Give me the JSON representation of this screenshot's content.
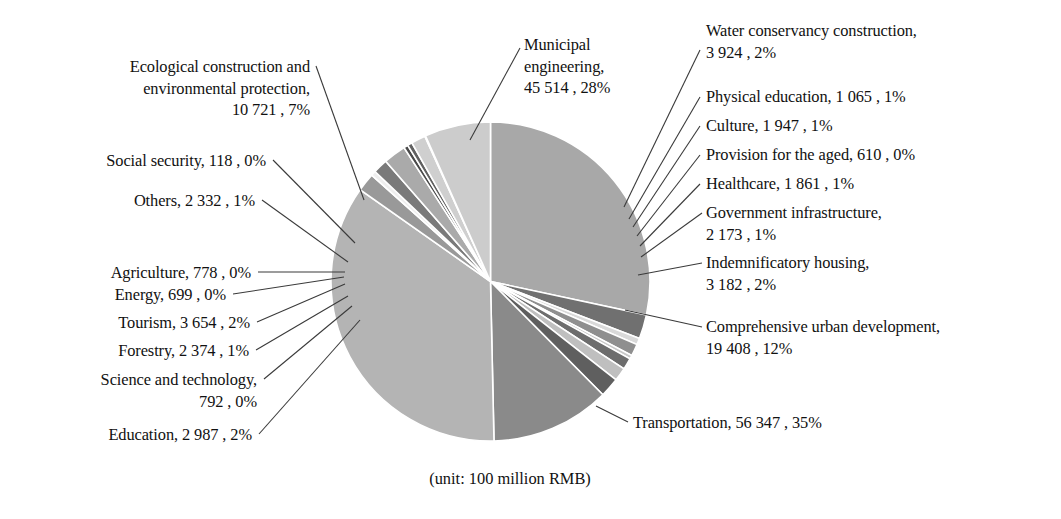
{
  "caption": "(unit: 100 million RMB)",
  "chart_data": {
    "type": "pie",
    "title": "",
    "subtitle": "",
    "unit_note": "(unit: 100 million RMB)",
    "value_unit": "100 million RMB",
    "total": 162486,
    "legend_position": "callout-labels",
    "start_angle_deg": 0,
    "direction": "clockwise",
    "categories": [
      "Municipal engineering",
      "Water conservancy construction",
      "Physical education",
      "Culture",
      "Provision for the aged",
      "Healthcare",
      "Government infrastructure",
      "Indemnificatory housing",
      "Comprehensive urban development",
      "Transportation",
      "Education",
      "Science and technology",
      "Forestry",
      "Tourism",
      "Energy",
      "Agriculture",
      "Others",
      "Social security",
      "Ecological construction and environmental protection"
    ],
    "values": [
      45514,
      3924,
      1065,
      1947,
      610,
      1861,
      2173,
      3182,
      19408,
      56347,
      2987,
      792,
      2374,
      3654,
      699,
      778,
      2332,
      118,
      10721
    ],
    "percent_labels": [
      "28%",
      "2%",
      "1%",
      "1%",
      "0%",
      "1%",
      "1%",
      "2%",
      "12%",
      "35%",
      "2%",
      "0%",
      "1%",
      "2%",
      "0%",
      "0%",
      "1%",
      "0%",
      "7%"
    ],
    "colors": [
      "#a8a8a8",
      "#707070",
      "#d9d9d9",
      "#8f8f8f",
      "#c8c8c8",
      "#6d6d6d",
      "#bfbfbf",
      "#5f5f5f",
      "#8a8a8a",
      "#b4b4b4",
      "#999999",
      "#efefef",
      "#7a7a7a",
      "#aaaaaa",
      "#4a4a4a",
      "#606060",
      "#cfcfcf",
      "#e6e6e6",
      "#cccccc"
    ],
    "slices": [
      {
        "label": "Municipal engineering",
        "value": "45 514",
        "percent": "28%",
        "text": "Municipal\nengineering,\n45 514 , 28%",
        "color": "#a8a8a8"
      },
      {
        "label": "Water conservancy construction",
        "value": "3 924",
        "percent": "2%",
        "text": "Water conservancy construction,\n3 924 , 2%",
        "color": "#707070"
      },
      {
        "label": "Physical education",
        "value": "1 065",
        "percent": "1%",
        "text": "Physical education, 1 065 , 1%",
        "color": "#d9d9d9"
      },
      {
        "label": "Culture",
        "value": "1 947",
        "percent": "1%",
        "text": "Culture, 1 947 , 1%",
        "color": "#8f8f8f"
      },
      {
        "label": "Provision for the aged",
        "value": "610",
        "percent": "0%",
        "text": "Provision for the aged, 610 , 0%",
        "color": "#c8c8c8"
      },
      {
        "label": "Healthcare",
        "value": "1 861",
        "percent": "1%",
        "text": "Healthcare, 1 861 , 1%",
        "color": "#6d6d6d"
      },
      {
        "label": "Government infrastructure",
        "value": "2 173",
        "percent": "1%",
        "text": "Government infrastructure,\n2 173 , 1%",
        "color": "#bfbfbf"
      },
      {
        "label": "Indemnificatory housing",
        "value": "3 182",
        "percent": "2%",
        "text": "Indemnificatory housing,\n3 182 , 2%",
        "color": "#5f5f5f"
      },
      {
        "label": "Comprehensive urban development",
        "value": "19 408",
        "percent": "12%",
        "text": "Comprehensive urban development,\n19 408 , 12%",
        "color": "#8a8a8a"
      },
      {
        "label": "Transportation",
        "value": "56 347",
        "percent": "35%",
        "text": "Transportation, 56 347 , 35%",
        "color": "#b4b4b4"
      },
      {
        "label": "Education",
        "value": "2 987",
        "percent": "2%",
        "text": "Education, 2 987 , 2%",
        "color": "#999999"
      },
      {
        "label": "Science and technology",
        "value": "792",
        "percent": "0%",
        "text": "Science and technology,\n792 , 0%",
        "color": "#efefef"
      },
      {
        "label": "Forestry",
        "value": "2 374",
        "percent": "1%",
        "text": "Forestry, 2 374 , 1%",
        "color": "#7a7a7a"
      },
      {
        "label": "Tourism",
        "value": "3 654",
        "percent": "2%",
        "text": "Tourism, 3 654 , 2%",
        "color": "#aaaaaa"
      },
      {
        "label": "Energy",
        "value": "699",
        "percent": "0%",
        "text": "Energy, 699 , 0%",
        "color": "#4a4a4a"
      },
      {
        "label": "Agriculture",
        "value": "778",
        "percent": "0%",
        "text": "Agriculture, 778 , 0%",
        "color": "#606060"
      },
      {
        "label": "Others",
        "value": "2 332",
        "percent": "1%",
        "text": "Others, 2 332 , 1%",
        "color": "#cfcfcf"
      },
      {
        "label": "Social security",
        "value": "118",
        "percent": "0%",
        "text": "Social security, 118 , 0%",
        "color": "#e6e6e6"
      },
      {
        "label": "Ecological construction and environmental protection",
        "value": "10 721",
        "percent": "7%",
        "text": "Ecological construction and\nenvironmental protection,\n10 721 , 7%",
        "color": "#cccccc"
      }
    ]
  },
  "labels": {
    "municipal_engineering": "Municipal\nengineering,\n45 514 , 28%",
    "water_conservancy": "Water conservancy construction,\n3 924 , 2%",
    "physical_education": "Physical education, 1 065 , 1%",
    "culture": "Culture, 1 947 , 1%",
    "provision_for_the_aged": "Provision for the aged, 610 , 0%",
    "healthcare": "Healthcare, 1 861 , 1%",
    "government_infrastructure": "Government infrastructure,\n2 173 , 1%",
    "indemnificatory_housing": "Indemnificatory housing,\n3 182 , 2%",
    "comprehensive_urban_development": "Comprehensive urban development,\n19 408 , 12%",
    "transportation": "Transportation, 56 347 , 35%",
    "education": "Education, 2 987 , 2%",
    "science_and_technology": "Science and technology,\n792 , 0%",
    "forestry": "Forestry, 2 374 , 1%",
    "tourism": "Tourism, 3 654 , 2%",
    "energy": "Energy, 699 , 0%",
    "agriculture": "Agriculture, 778 , 0%",
    "others": "Others, 2 332 , 1%",
    "social_security": "Social security, 118 , 0%",
    "ecological_construction": "Ecological construction and\nenvironmental protection,\n10 721 , 7%"
  }
}
